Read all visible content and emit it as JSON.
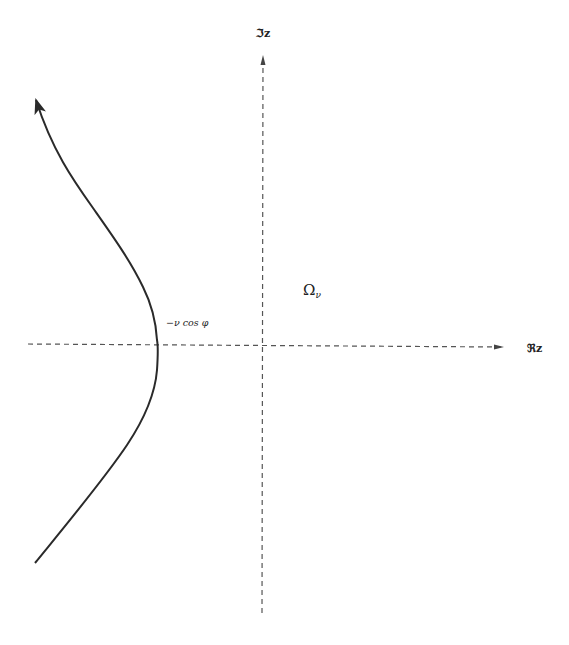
{
  "diagram": {
    "title": "",
    "axes": {
      "horizontal": {
        "label": "ℜz",
        "style": "dashed",
        "from": [
          28,
          344
        ],
        "to": [
          503,
          347
        ]
      },
      "vertical": {
        "label": "ℑz",
        "style": "dashed",
        "from": [
          262,
          613
        ],
        "to": [
          263,
          56
        ]
      },
      "origin": [
        263,
        344
      ]
    },
    "region": {
      "symbol": "Ω",
      "subscript": "ν"
    },
    "curve": {
      "description": "contour opening to the left, vertex on negative real axis",
      "vertex_label": "−ν cos φ",
      "vertex": [
        157,
        344
      ],
      "start": [
        35,
        563
      ],
      "end_arrow": [
        36,
        100
      ],
      "direction": "bottom-to-top"
    },
    "colors": {
      "stroke": "#2a2a2a",
      "axis": "#555555",
      "text": "#222222",
      "background": "#ffffff"
    }
  }
}
